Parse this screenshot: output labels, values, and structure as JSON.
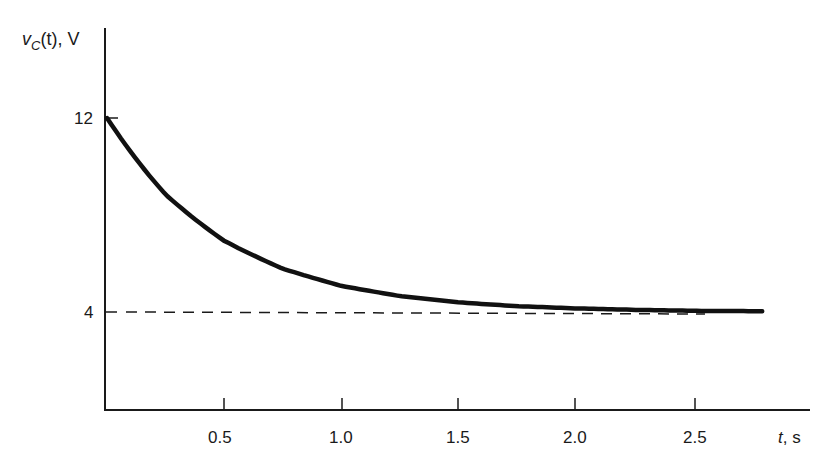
{
  "chart_data": {
    "type": "line",
    "title": "",
    "xlabel": "t, s",
    "ylabel": "v_C(t), V",
    "xlim": [
      0,
      2.9
    ],
    "ylim": [
      0,
      15.5
    ],
    "x_ticks": [
      0.5,
      1.0,
      1.5,
      2.0,
      2.5
    ],
    "x_tick_labels": [
      "0.5",
      "1.0",
      "1.5",
      "2.0",
      "2.5"
    ],
    "y_ticks": [
      4,
      12
    ],
    "y_tick_labels": [
      "4",
      "12"
    ],
    "grid": false,
    "legend": null,
    "series": [
      {
        "name": "v_C(t) = 4 + 8e^(-2t)",
        "style": "solid-thick",
        "x": [
          0,
          0.25,
          0.5,
          0.75,
          1.0,
          1.25,
          1.5,
          1.75,
          2.0,
          2.25,
          2.5,
          2.8
        ],
        "values": [
          12.0,
          8.85,
          6.94,
          5.79,
          5.08,
          4.66,
          4.4,
          4.24,
          4.15,
          4.09,
          4.05,
          4.03
        ]
      },
      {
        "name": "asymptote",
        "style": "dashed",
        "x": [
          0,
          2.7
        ],
        "values": [
          4,
          4
        ]
      }
    ]
  },
  "labels": {
    "y_axis_main": "v",
    "y_axis_sub": "C",
    "y_axis_rest": "(t), V",
    "x_axis_t": "t",
    "x_axis_rest": ", s",
    "y12": "12",
    "y4": "4",
    "x05": "0.5",
    "x10": "1.0",
    "x15": "1.5",
    "x20": "2.0",
    "x25": "2.5"
  }
}
